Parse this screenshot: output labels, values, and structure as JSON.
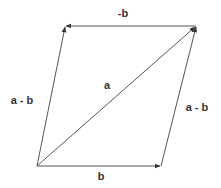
{
  "diagram": {
    "colors": {
      "stroke": "#555555",
      "text": "#333333"
    },
    "points": {
      "bottom_left": [
        37,
        166
      ],
      "bottom_right": [
        161,
        166
      ],
      "top_left": [
        65,
        26
      ],
      "top_right": [
        196,
        26
      ]
    },
    "vectors": [
      {
        "id": "b",
        "from": "bottom_left",
        "to": "bottom_right",
        "label": "b"
      },
      {
        "id": "a",
        "from": "bottom_left",
        "to": "top_right",
        "label": "a"
      },
      {
        "id": "a-minus-b-left",
        "from": "bottom_left",
        "to": "top_left",
        "label": "a - b"
      },
      {
        "id": "a-minus-b-right",
        "from": "bottom_right",
        "to": "top_right",
        "label": "a - b"
      },
      {
        "id": "neg-b",
        "from": "top_right",
        "to": "top_left",
        "label": "-b"
      }
    ],
    "labels": {
      "b": "b",
      "a": "a",
      "a_minus_b_left": "a - b",
      "a_minus_b_right": "a - b",
      "neg_b": "-b"
    }
  }
}
